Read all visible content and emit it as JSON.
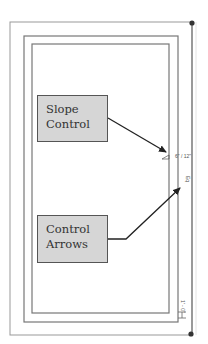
{
  "diagram": {
    "callouts": [
      {
        "id": "slope-control",
        "lines": [
          "Slope",
          "Control"
        ]
      },
      {
        "id": "control-arrows",
        "lines": [
          "Control",
          "Arrows"
        ]
      }
    ],
    "annotations": {
      "slope_label": "6\" / 12\"",
      "eq_label": "Eq",
      "dimension_label": "1' - 0\""
    },
    "colors": {
      "lines": "#888888",
      "dark_lines": "#666666",
      "arrows": "#222222",
      "callout_fill": "#d6d6d6",
      "callout_border": "#555555"
    }
  }
}
